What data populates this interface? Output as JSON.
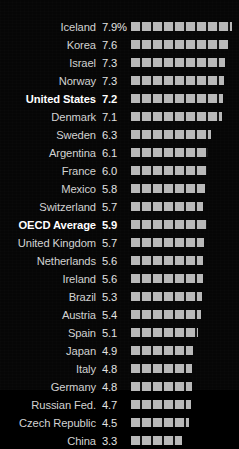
{
  "chart_data": {
    "type": "bar",
    "orientation": "horizontal",
    "title": "",
    "xlabel": "",
    "ylabel": "",
    "grid": false,
    "legend": null,
    "value_suffix_first_row": "%",
    "xlim": [
      0,
      7.9
    ],
    "categories": [
      "Iceland",
      "Korea",
      "Israel",
      "Norway",
      "United States",
      "Denmark",
      "Sweden",
      "Argentina",
      "France",
      "Mexico",
      "Switzerland",
      "OECD Average",
      "United Kingdom",
      "Netherlands",
      "Ireland",
      "Brazil",
      "Austria",
      "Spain",
      "Japan",
      "Italy",
      "Germany",
      "Russian Fed.",
      "Czech Republic",
      "China"
    ],
    "values": [
      7.9,
      7.6,
      7.3,
      7.3,
      7.2,
      7.1,
      6.3,
      6.1,
      6.0,
      5.8,
      5.7,
      5.9,
      5.7,
      5.6,
      5.6,
      5.3,
      5.4,
      5.1,
      4.9,
      4.8,
      4.8,
      4.7,
      4.5,
      3.3
    ],
    "value_labels": [
      "7.9%",
      "7.6",
      "7.3",
      "7.3",
      "7.2",
      "7.1",
      "6.3",
      "6.1",
      "6.0",
      "5.8",
      "5.7",
      "5.9",
      "5.7",
      "5.6",
      "5.6",
      "5.3",
      "5.4",
      "5.1",
      "4.9",
      "4.8",
      "4.8",
      "4.7",
      "4.5",
      "3.3"
    ],
    "bar_pixel_lengths": [
      101,
      97,
      94,
      93,
      92,
      91,
      80,
      77,
      76,
      74,
      72,
      76,
      73,
      72,
      72,
      71,
      70,
      67,
      62,
      61,
      61,
      60,
      58,
      51
    ],
    "highlighted": [
      "United States",
      "OECD Average"
    ],
    "colors": {
      "background": "#060606",
      "bar": "#b9b9b9",
      "label": "#d2d2d2",
      "value": "#e2e2e2",
      "highlight": "#ffffff"
    }
  }
}
